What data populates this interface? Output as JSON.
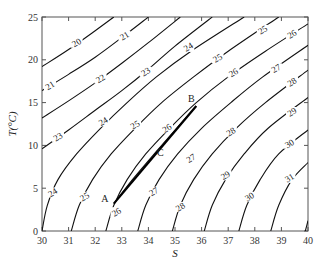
{
  "chart_data": {
    "type": "line",
    "title": "",
    "xlabel": "S",
    "ylabel": "T(°C)",
    "xlim": [
      30,
      40
    ],
    "ylim": [
      0,
      25
    ],
    "xticks": [
      30,
      31,
      32,
      33,
      34,
      35,
      36,
      37,
      38,
      39,
      40
    ],
    "yticks": [
      0,
      5,
      10,
      15,
      20,
      25
    ],
    "grid": false,
    "legend": "none",
    "contours": [
      {
        "label": "20",
        "points": [
          [
            30,
            19.2
          ],
          [
            31,
            21.2
          ],
          [
            32,
            23.4
          ],
          [
            32.7,
            25
          ]
        ],
        "label_at": [
          31.3,
          22
        ]
      },
      {
        "label": "21",
        "points": [
          [
            30,
            16.4
          ],
          [
            31,
            18.3
          ],
          [
            32,
            20.3
          ],
          [
            33,
            22.6
          ],
          [
            34.0,
            25
          ]
        ],
        "label_at": [
          30.3,
          17
        ]
      },
      {
        "label": "21",
        "points": [],
        "label_at": [
          33.1,
          22.8
        ]
      },
      {
        "label": "22",
        "points": [
          [
            30,
            13.2
          ],
          [
            31,
            15.2
          ],
          [
            32,
            17.3
          ],
          [
            33,
            19.6
          ],
          [
            34,
            22
          ],
          [
            35.2,
            25
          ]
        ],
        "label_at": [
          32.2,
          17.8
        ]
      },
      {
        "label": "23",
        "points": [
          [
            30,
            9.6
          ],
          [
            31,
            11.8
          ],
          [
            32,
            14.1
          ],
          [
            33,
            16.4
          ],
          [
            34,
            18.9
          ],
          [
            35,
            21.6
          ],
          [
            36.4,
            25
          ]
        ],
        "label_at": [
          33.9,
          18.6
        ]
      },
      {
        "label": "23",
        "points": [],
        "label_at": [
          30.6,
          11
        ]
      },
      {
        "label": "24",
        "points": [
          [
            30,
            0
          ],
          [
            30.2,
            3
          ],
          [
            30.6,
            6
          ],
          [
            31.3,
            9
          ],
          [
            32.2,
            12
          ],
          [
            33.2,
            15
          ],
          [
            34.3,
            18
          ],
          [
            35.6,
            21
          ],
          [
            37.6,
            25
          ]
        ],
        "label_at": [
          30.4,
          4.5
        ]
      },
      {
        "label": "24",
        "points": [],
        "label_at": [
          32.3,
          12.8
        ]
      },
      {
        "label": "24",
        "points": [],
        "label_at": [
          35.5,
          21.5
        ]
      },
      {
        "label": "25",
        "points": [
          [
            31.1,
            0
          ],
          [
            31.4,
            3
          ],
          [
            31.9,
            6
          ],
          [
            32.6,
            9
          ],
          [
            33.5,
            12
          ],
          [
            34.5,
            15
          ],
          [
            35.7,
            18
          ],
          [
            37,
            21
          ],
          [
            38.9,
            25
          ]
        ],
        "label_at": [
          31.6,
          4
        ]
      },
      {
        "label": "25",
        "points": [],
        "label_at": [
          33.5,
          12.4
        ]
      },
      {
        "label": "25",
        "points": [],
        "label_at": [
          36.6,
          20.2
        ]
      },
      {
        "label": "25",
        "points": [],
        "label_at": [
          38.3,
          23.5
        ]
      },
      {
        "label": "26",
        "points": [
          [
            32.4,
            0
          ],
          [
            32.7,
            3
          ],
          [
            33.2,
            6
          ],
          [
            33.9,
            9
          ],
          [
            34.8,
            12
          ],
          [
            35.8,
            15
          ],
          [
            37,
            18
          ],
          [
            38.4,
            21
          ],
          [
            40,
            24.2
          ]
        ],
        "label_at": [
          32.8,
          2.2
        ]
      },
      {
        "label": "26",
        "points": [],
        "label_at": [
          34.7,
          12
        ]
      },
      {
        "label": "26",
        "points": [],
        "label_at": [
          37.2,
          18.5
        ]
      },
      {
        "label": "26",
        "points": [],
        "label_at": [
          39.4,
          23
        ]
      },
      {
        "label": "27",
        "points": [
          [
            33.6,
            0
          ],
          [
            33.9,
            3
          ],
          [
            34.4,
            6
          ],
          [
            35.1,
            9
          ],
          [
            36,
            12
          ],
          [
            37.1,
            15
          ],
          [
            38.3,
            18
          ],
          [
            40,
            21.7
          ]
        ],
        "label_at": [
          34.2,
          4.6
        ]
      },
      {
        "label": "27",
        "points": [],
        "label_at": [
          35.6,
          8.5
        ]
      },
      {
        "label": "27",
        "points": [],
        "label_at": [
          38.8,
          19
        ]
      },
      {
        "label": "28",
        "points": [
          [
            34.9,
            0
          ],
          [
            35.2,
            3
          ],
          [
            35.7,
            6
          ],
          [
            36.4,
            9
          ],
          [
            37.3,
            12
          ],
          [
            38.4,
            15
          ],
          [
            40,
            18.8
          ]
        ],
        "label_at": [
          35.2,
          2.8
        ]
      },
      {
        "label": "28",
        "points": [],
        "label_at": [
          37.1,
          11.6
        ]
      },
      {
        "label": "28",
        "points": [],
        "label_at": [
          39.4,
          17.4
        ]
      },
      {
        "label": "29",
        "points": [
          [
            36.1,
            0
          ],
          [
            36.4,
            3
          ],
          [
            36.9,
            6
          ],
          [
            37.6,
            9
          ],
          [
            38.5,
            12
          ],
          [
            40,
            15.6
          ]
        ],
        "label_at": [
          36.9,
          6.5
        ]
      },
      {
        "label": "29",
        "points": [],
        "label_at": [
          39.4,
          13.9
        ]
      },
      {
        "label": "30",
        "points": [
          [
            37.4,
            0
          ],
          [
            37.7,
            3
          ],
          [
            38.2,
            6
          ],
          [
            38.9,
            9
          ],
          [
            40,
            11.8
          ]
        ],
        "label_at": [
          37.8,
          4
        ]
      },
      {
        "label": "30",
        "points": [],
        "label_at": [
          39.3,
          10.2
        ]
      },
      {
        "label": "31",
        "points": [
          [
            38.6,
            0
          ],
          [
            38.9,
            3
          ],
          [
            39.4,
            6
          ],
          [
            40,
            8
          ]
        ],
        "label_at": [
          39.3,
          6.2
        ]
      },
      {
        "label": "32",
        "points": [
          [
            39.9,
            0
          ],
          [
            40,
            1.2
          ]
        ],
        "label_at": null
      }
    ],
    "mixing_line": {
      "points": [
        [
          32.7,
          3.2
        ],
        [
          35.8,
          14.6
        ]
      ],
      "annotations": [
        {
          "text": "A",
          "at": [
            32.7,
            3.2
          ],
          "offset": [
            -9,
            -2
          ]
        },
        {
          "text": "B",
          "at": [
            35.8,
            14.6
          ],
          "offset": [
            -5,
            -4
          ]
        },
        {
          "text": "C",
          "at": [
            34.3,
            9.2
          ],
          "offset": [
            4,
            4
          ]
        }
      ]
    },
    "isopycnal_AB": {
      "points": [
        [
          32.7,
          3.2
        ],
        [
          33.4,
          6
        ],
        [
          34.3,
          9.3
        ],
        [
          35.0,
          11.8
        ],
        [
          35.8,
          14.6
        ]
      ]
    }
  }
}
